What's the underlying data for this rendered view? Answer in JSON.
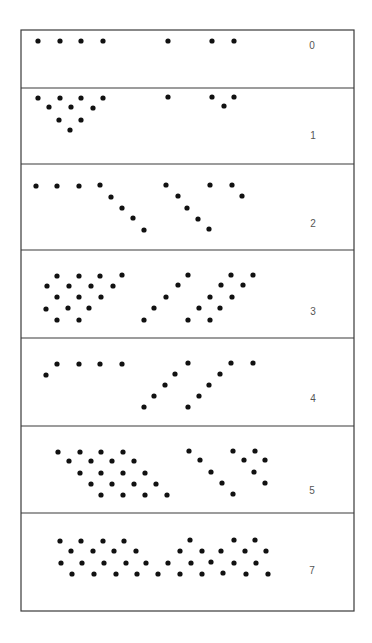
{
  "figure": {
    "frame": {
      "x": 21,
      "y": 30,
      "w": 333,
      "h": 581
    },
    "dot_radius": 2.6,
    "dot_color": "#111111",
    "panels": [
      {
        "label": "0",
        "top": 30,
        "bottom": 88,
        "label_pos": [
          312,
          49
        ],
        "dots": [
          [
            38,
            41
          ],
          [
            60,
            41
          ],
          [
            81,
            41
          ],
          [
            103,
            41
          ],
          [
            168,
            41
          ],
          [
            212,
            41
          ],
          [
            234,
            41
          ]
        ]
      },
      {
        "label": "1",
        "top": 88,
        "bottom": 164,
        "label_pos": [
          313,
          139
        ],
        "dots": [
          [
            38,
            98
          ],
          [
            60,
            98
          ],
          [
            81,
            98
          ],
          [
            103,
            98
          ],
          [
            168,
            97
          ],
          [
            212,
            97
          ],
          [
            234,
            97
          ],
          [
            49,
            107
          ],
          [
            71,
            107
          ],
          [
            93,
            108
          ],
          [
            224,
            106
          ],
          [
            59,
            120
          ],
          [
            81,
            120
          ],
          [
            70,
            130
          ]
        ]
      },
      {
        "label": "2",
        "top": 164,
        "bottom": 250,
        "label_pos": [
          313,
          227
        ],
        "dots": [
          [
            36,
            186
          ],
          [
            57,
            186
          ],
          [
            79,
            186
          ],
          [
            100,
            185
          ],
          [
            111,
            197
          ],
          [
            122,
            208
          ],
          [
            133,
            218
          ],
          [
            144,
            230
          ],
          [
            166,
            185
          ],
          [
            178,
            196
          ],
          [
            187,
            208
          ],
          [
            198,
            219
          ],
          [
            209,
            229
          ],
          [
            210,
            185
          ],
          [
            232,
            185
          ],
          [
            242,
            196
          ]
        ]
      },
      {
        "label": "3",
        "top": 250,
        "bottom": 338,
        "label_pos": [
          313,
          315
        ],
        "dots": [
          [
            57,
            276
          ],
          [
            79,
            276
          ],
          [
            100,
            276
          ],
          [
            122,
            275
          ],
          [
            47,
            286
          ],
          [
            69,
            286
          ],
          [
            91,
            286
          ],
          [
            113,
            286
          ],
          [
            57,
            297
          ],
          [
            79,
            297
          ],
          [
            101,
            297
          ],
          [
            46,
            309
          ],
          [
            68,
            308
          ],
          [
            89,
            308
          ],
          [
            57,
            320
          ],
          [
            79,
            320
          ],
          [
            144,
            320
          ],
          [
            154,
            308
          ],
          [
            166,
            297
          ],
          [
            178,
            285
          ],
          [
            188,
            275
          ],
          [
            188,
            320
          ],
          [
            199,
            308
          ],
          [
            210,
            297
          ],
          [
            221,
            285
          ],
          [
            231,
            275
          ],
          [
            210,
            320
          ],
          [
            220,
            308
          ],
          [
            232,
            297
          ],
          [
            243,
            285
          ],
          [
            253,
            275
          ]
        ]
      },
      {
        "label": "4",
        "top": 338,
        "bottom": 426,
        "label_pos": [
          313,
          402
        ],
        "dots": [
          [
            46,
            375
          ],
          [
            57,
            364
          ],
          [
            79,
            364
          ],
          [
            100,
            364
          ],
          [
            122,
            364
          ],
          [
            144,
            407
          ],
          [
            154,
            396
          ],
          [
            165,
            385
          ],
          [
            175,
            374
          ],
          [
            188,
            363
          ],
          [
            188,
            407
          ],
          [
            199,
            396
          ],
          [
            209,
            385
          ],
          [
            220,
            374
          ],
          [
            231,
            363
          ],
          [
            253,
            363
          ]
        ]
      },
      {
        "label": "5",
        "top": 426,
        "bottom": 513,
        "label_pos": [
          312,
          494
        ],
        "dots": [
          [
            58,
            452
          ],
          [
            80,
            452
          ],
          [
            101,
            452
          ],
          [
            123,
            452
          ],
          [
            69,
            461
          ],
          [
            91,
            461
          ],
          [
            112,
            461
          ],
          [
            134,
            461
          ],
          [
            80,
            473
          ],
          [
            101,
            473
          ],
          [
            123,
            473
          ],
          [
            145,
            473
          ],
          [
            91,
            484
          ],
          [
            112,
            484
          ],
          [
            134,
            484
          ],
          [
            156,
            484
          ],
          [
            101,
            495
          ],
          [
            123,
            495
          ],
          [
            145,
            495
          ],
          [
            167,
            495
          ],
          [
            189,
            451
          ],
          [
            200,
            460
          ],
          [
            211,
            472
          ],
          [
            222,
            483
          ],
          [
            233,
            494
          ],
          [
            233,
            451
          ],
          [
            244,
            460
          ],
          [
            255,
            451
          ],
          [
            265,
            460
          ],
          [
            254,
            472
          ],
          [
            265,
            483
          ]
        ]
      },
      {
        "label": "7",
        "top": 513,
        "bottom": 611,
        "label_pos": [
          312,
          574
        ],
        "dots": [
          [
            60,
            541
          ],
          [
            81,
            541
          ],
          [
            103,
            541
          ],
          [
            124,
            541
          ],
          [
            190,
            540
          ],
          [
            234,
            540
          ],
          [
            255,
            540
          ],
          [
            71,
            551
          ],
          [
            93,
            551
          ],
          [
            114,
            551
          ],
          [
            136,
            551
          ],
          [
            180,
            551
          ],
          [
            202,
            551
          ],
          [
            221,
            551
          ],
          [
            245,
            551
          ],
          [
            266,
            551
          ],
          [
            61,
            563
          ],
          [
            82,
            563
          ],
          [
            104,
            563
          ],
          [
            126,
            563
          ],
          [
            146,
            563
          ],
          [
            168,
            563
          ],
          [
            191,
            563
          ],
          [
            211,
            562
          ],
          [
            234,
            563
          ],
          [
            256,
            563
          ],
          [
            72,
            574
          ],
          [
            94,
            574
          ],
          [
            116,
            574
          ],
          [
            137,
            574
          ],
          [
            158,
            574
          ],
          [
            180,
            574
          ],
          [
            202,
            574
          ],
          [
            223,
            573
          ],
          [
            246,
            574
          ],
          [
            268,
            574
          ]
        ]
      }
    ]
  }
}
